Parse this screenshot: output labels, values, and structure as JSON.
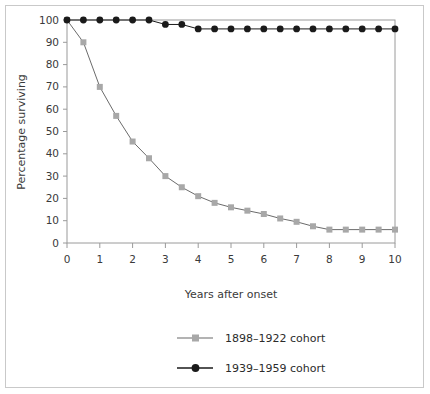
{
  "chart_data": {
    "type": "line",
    "title": "",
    "xlabel": "Years after onset",
    "ylabel": "Percentage surviving",
    "xlim": [
      0,
      10
    ],
    "ylim": [
      0,
      100
    ],
    "xticks": [
      "0",
      "1",
      "2",
      "3",
      "4",
      "5",
      "6",
      "7",
      "8",
      "9",
      "10"
    ],
    "yticks": [
      "0",
      "10",
      "20",
      "30",
      "40",
      "50",
      "60",
      "70",
      "80",
      "90",
      "100"
    ],
    "grid": false,
    "legend_position": "bottom-center",
    "x": [
      0,
      0.5,
      1,
      1.5,
      2,
      2.5,
      3,
      3.5,
      4,
      4.5,
      5,
      5.5,
      6,
      6.5,
      7,
      7.5,
      8,
      8.5,
      9,
      9.5,
      10
    ],
    "series": [
      {
        "name": "1898–1922 cohort",
        "color": "#a8a8a8",
        "line_color": "#6b6b6b",
        "marker": "square",
        "values": [
          100,
          90,
          70,
          57,
          45.5,
          38,
          30,
          25,
          21,
          18,
          16,
          14.5,
          13,
          11,
          9.5,
          7.5,
          6,
          6,
          6,
          6,
          6
        ]
      },
      {
        "name": "1939–1959 cohort",
        "color": "#1a1a1a",
        "line_color": "#1a1a1a",
        "marker": "circle",
        "values": [
          100,
          100,
          100,
          100,
          100,
          100,
          98,
          98,
          96,
          96,
          96,
          96,
          96,
          96,
          96,
          96,
          96,
          96,
          96,
          96,
          96
        ]
      }
    ]
  },
  "legend": {
    "items": [
      {
        "label": "1898–1922 cohort",
        "marker": "square",
        "color": "#a8a8a8"
      },
      {
        "label": "1939–1959 cohort",
        "marker": "circle",
        "color": "#1a1a1a"
      }
    ]
  }
}
